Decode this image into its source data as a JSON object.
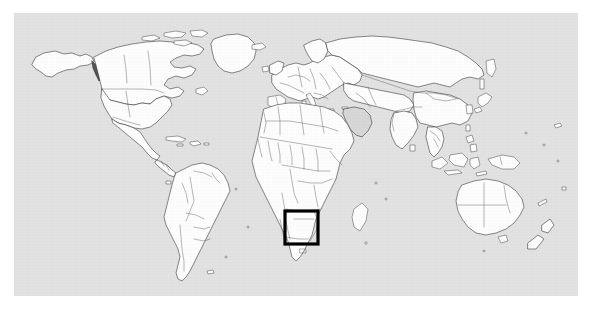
{
  "figure": {
    "type": "world-locator-map",
    "title": "",
    "caption": "",
    "projection": "equirectangular",
    "background_color": "#e2e2e2",
    "page_color": "#ffffff",
    "land_fill": "#fdfdfd",
    "coastline_color": "#2b2b2b",
    "border_color": "#4a4a4a",
    "frame": {
      "left_px": 14,
      "top_px": 13,
      "width_px": 564,
      "height_px": 283
    }
  },
  "highlight": {
    "label": "",
    "shape": "rectangle",
    "stroke_color": "#000000",
    "stroke_width_px": 3.2,
    "region_name": "southern-africa",
    "box_px": {
      "x": 271,
      "y": 198,
      "width": 33,
      "height": 33
    },
    "box_degrees": {
      "west": 18,
      "east": 39,
      "south": -22,
      "north": -8
    }
  },
  "map": {
    "continents": [
      "north-america",
      "south-america",
      "europe",
      "africa",
      "asia",
      "oceania",
      "antarctica-excluded"
    ],
    "features_shown": [
      "coastlines",
      "country-borders",
      "major-islands"
    ],
    "graticule": false,
    "labels": false,
    "legend": false
  }
}
